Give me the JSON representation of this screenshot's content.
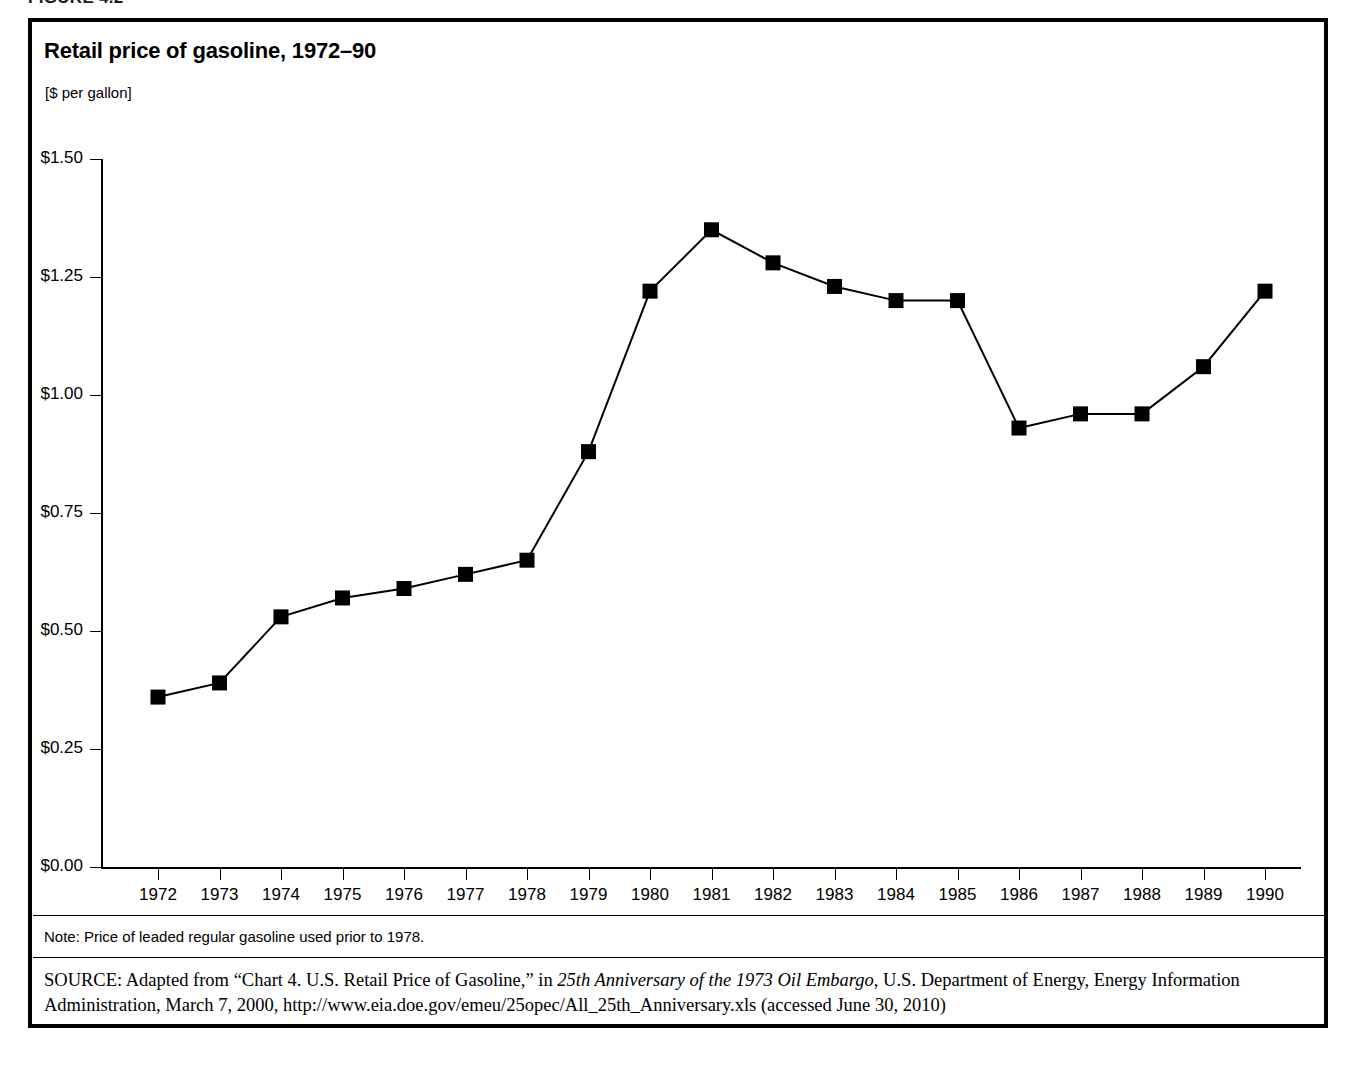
{
  "figure": {
    "number_label": "FIGURE 4.2",
    "title": "Retail price of gasoline, 1972–90",
    "units": "[$ per gallon]",
    "note": "Note: Price of leaded regular gasoline used prior to 1978.",
    "source_label": "SOURCE:",
    "source_text_1": " Adapted from “Chart 4. U.S. Retail Price of Gasoline,” in ",
    "source_italic_1": "25th Anniversary of the 1973 Oil Embargo",
    "source_text_2": ", U.S. Department of Energy, Energy Information Administration, March 7, 2000, http://www.eia.doe.gov/emeu/25opec/All_25th_Anniversary.xls (accessed June 30, 2010)"
  },
  "colors": {
    "line": "#000000",
    "marker": "#000000",
    "axis": "#000000",
    "background": "#ffffff",
    "text": "#000000"
  },
  "chart_data": {
    "type": "line",
    "title": "Retail price of gasoline, 1972–90",
    "subtitle": "[$ per gallon]",
    "xlabel": "",
    "ylabel": "$ per gallon",
    "ylim": [
      0.0,
      1.5
    ],
    "ytick_step": 0.25,
    "ytick_labels": [
      "$0.00",
      "$0.25",
      "$0.50",
      "$0.75",
      "$1.00",
      "$1.25",
      "$1.50"
    ],
    "ytick_values": [
      0.0,
      0.25,
      0.5,
      0.75,
      1.0,
      1.25,
      1.5
    ],
    "grid": false,
    "legend": false,
    "marker_style": "filled-square",
    "categories": [
      "1972",
      "1973",
      "1974",
      "1975",
      "1976",
      "1977",
      "1978",
      "1979",
      "1980",
      "1981",
      "1982",
      "1983",
      "1984",
      "1985",
      "1986",
      "1987",
      "1988",
      "1989",
      "1990"
    ],
    "values": [
      0.36,
      0.39,
      0.53,
      0.57,
      0.59,
      0.62,
      0.65,
      0.88,
      1.22,
      1.35,
      1.28,
      1.23,
      1.2,
      1.2,
      0.93,
      0.96,
      0.96,
      1.06,
      1.22
    ],
    "series": [
      {
        "name": "Retail price of gasoline",
        "values": [
          0.36,
          0.39,
          0.53,
          0.57,
          0.59,
          0.62,
          0.65,
          0.88,
          1.22,
          1.35,
          1.28,
          1.23,
          1.2,
          1.2,
          0.93,
          0.96,
          0.96,
          1.06,
          1.22
        ]
      }
    ]
  }
}
